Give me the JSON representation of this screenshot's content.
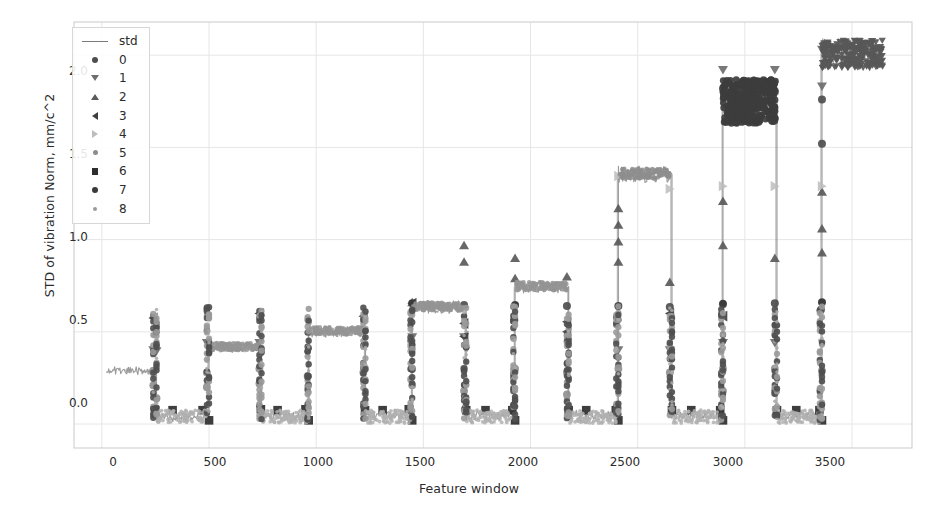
{
  "chart_data": {
    "type": "scatter",
    "title": "",
    "xlabel": "Feature window",
    "ylabel": "STD of vibration Norm, mm/c^2",
    "xlim": [
      -130,
      3780
    ],
    "ylim": [
      -0.13,
      2.18
    ],
    "xticks": [
      0,
      500,
      1000,
      1500,
      2000,
      2500,
      3000,
      3500
    ],
    "xticklabels": [
      "0",
      "500",
      "1000",
      "1500",
      "2000",
      "2500",
      "3000",
      "3500"
    ],
    "yticks": [
      0.0,
      0.5,
      1.0,
      1.5,
      2.0
    ],
    "yticklabels": [
      "0.0",
      "0.5",
      "1.0",
      "1.5",
      "2.0"
    ],
    "grid": true,
    "legend_position": "upper left",
    "legend_entries": [
      {
        "label": "std",
        "marker": "line",
        "color": "#7b7b7b"
      },
      {
        "label": "0",
        "marker": "circle",
        "color": "#4e4e4e"
      },
      {
        "label": "1",
        "marker": "triangle-down",
        "color": "#6e6e6e"
      },
      {
        "label": "2",
        "marker": "triangle-up",
        "color": "#5a5a5a"
      },
      {
        "label": "3",
        "marker": "triangle-left",
        "color": "#3f3f3f"
      },
      {
        "label": "4",
        "marker": "triangle-right",
        "color": "#bdbdbd"
      },
      {
        "label": "5",
        "marker": "circle-small",
        "color": "#8d8d8d"
      },
      {
        "label": "6",
        "marker": "square",
        "color": "#2e2e2e"
      },
      {
        "label": "7",
        "marker": "circle-med",
        "color": "#3a3a3a"
      },
      {
        "label": "8",
        "marker": "circle-tiny",
        "color": "#9b9b9b"
      }
    ],
    "series": [
      {
        "name": "std",
        "color": "#8a8a8a",
        "description": "Continuous std signal forming rising step plateaus with near-zero valleys",
        "segments": [
          {
            "x_start": 20,
            "x_end": 240,
            "level": 0.29,
            "noise": 0.022
          },
          {
            "x_start": 255,
            "x_end": 490,
            "level": 0.035,
            "noise": 0.025
          },
          {
            "x_start": 500,
            "x_end": 735,
            "level": 0.415,
            "noise": 0.028
          },
          {
            "x_start": 745,
            "x_end": 960,
            "level": 0.04,
            "noise": 0.025
          },
          {
            "x_start": 965,
            "x_end": 1220,
            "level": 0.5,
            "noise": 0.03
          },
          {
            "x_start": 1230,
            "x_end": 1440,
            "level": 0.045,
            "noise": 0.025
          },
          {
            "x_start": 1448,
            "x_end": 1690,
            "level": 0.635,
            "noise": 0.035
          },
          {
            "x_start": 1700,
            "x_end": 1920,
            "level": 0.05,
            "noise": 0.025
          },
          {
            "x_start": 1928,
            "x_end": 2170,
            "level": 0.745,
            "noise": 0.035
          },
          {
            "x_start": 2178,
            "x_end": 2400,
            "level": 0.05,
            "noise": 0.025
          },
          {
            "x_start": 2410,
            "x_end": 2650,
            "level": 1.355,
            "noise": 0.045
          },
          {
            "x_start": 2660,
            "x_end": 2890,
            "level": 0.05,
            "noise": 0.025
          },
          {
            "x_start": 2898,
            "x_end": 3140,
            "level": 1.755,
            "noise": 0.095
          },
          {
            "x_start": 3150,
            "x_end": 3350,
            "level": 0.05,
            "noise": 0.025
          },
          {
            "x_start": 3360,
            "x_end": 3640,
            "level": 2.015,
            "noise": 0.075
          }
        ]
      },
      {
        "name": "0",
        "marker": "circle",
        "color": "#4e4e4e",
        "description": "Mid-high cluster markers on the rising transitions",
        "points": [
          {
            "x": 1448,
            "y": 0.655
          },
          {
            "x": 1690,
            "y": 0.645
          },
          {
            "x": 1928,
            "y": 0.645
          },
          {
            "x": 2170,
            "y": 0.64
          },
          {
            "x": 2410,
            "y": 0.64
          },
          {
            "x": 2650,
            "y": 0.635
          },
          {
            "x": 2898,
            "y": 1.82
          },
          {
            "x": 3140,
            "y": 1.8
          },
          {
            "x": 2898,
            "y": 0.65
          },
          {
            "x": 3140,
            "y": 0.655
          },
          {
            "x": 3360,
            "y": 1.76
          },
          {
            "x": 3360,
            "y": 1.52
          },
          {
            "x": 3360,
            "y": 0.66
          },
          {
            "x": 3355,
            "y": 0.62
          }
        ]
      },
      {
        "name": "1",
        "marker": "triangle-down",
        "color": "#6e6e6e",
        "description": "Upper-extreme markers capping each plateau transition",
        "points": [
          {
            "x": 240,
            "y": 0.4
          },
          {
            "x": 255,
            "y": 0.395
          },
          {
            "x": 490,
            "y": 0.44
          },
          {
            "x": 735,
            "y": 0.44
          },
          {
            "x": 1220,
            "y": 0.5
          },
          {
            "x": 1448,
            "y": 0.47
          },
          {
            "x": 1690,
            "y": 0.47
          },
          {
            "x": 2410,
            "y": 0.4
          },
          {
            "x": 2650,
            "y": 0.4
          },
          {
            "x": 2898,
            "y": 1.92
          },
          {
            "x": 3140,
            "y": 1.92
          },
          {
            "x": 3360,
            "y": 2.03
          },
          {
            "x": 3360,
            "y": 1.83
          },
          {
            "x": 2898,
            "y": 0.44
          },
          {
            "x": 3140,
            "y": 0.44
          }
        ]
      },
      {
        "name": "2",
        "marker": "triangle-up",
        "color": "#5a5a5a",
        "description": "Peak markers of each step, rising left to right",
        "points": [
          {
            "x": 1448,
            "y": 0.66
          },
          {
            "x": 1690,
            "y": 0.97
          },
          {
            "x": 1690,
            "y": 0.88
          },
          {
            "x": 1928,
            "y": 0.9
          },
          {
            "x": 1928,
            "y": 0.79
          },
          {
            "x": 2170,
            "y": 0.8
          },
          {
            "x": 2410,
            "y": 1.17
          },
          {
            "x": 2410,
            "y": 1.08
          },
          {
            "x": 2410,
            "y": 0.99
          },
          {
            "x": 2410,
            "y": 0.88
          },
          {
            "x": 2650,
            "y": 0.77
          },
          {
            "x": 2898,
            "y": 1.21
          },
          {
            "x": 2898,
            "y": 0.97
          },
          {
            "x": 3140,
            "y": 0.9
          },
          {
            "x": 3360,
            "y": 1.26
          },
          {
            "x": 3360,
            "y": 1.06
          },
          {
            "x": 3360,
            "y": 0.93
          }
        ]
      },
      {
        "name": "3",
        "marker": "triangle-left",
        "color": "#3f3f3f",
        "description": "High single markers at segment starts",
        "points": [
          {
            "x": 240,
            "y": 0.575
          },
          {
            "x": 735,
            "y": 0.6
          },
          {
            "x": 1220,
            "y": 0.585
          },
          {
            "x": 1448,
            "y": 0.655
          },
          {
            "x": 1690,
            "y": 0.545
          },
          {
            "x": 1690,
            "y": 0.475
          },
          {
            "x": 2170,
            "y": 0.555
          },
          {
            "x": 2170,
            "y": 0.5
          },
          {
            "x": 2650,
            "y": 0.6
          },
          {
            "x": 2898,
            "y": 0.585
          }
        ]
      },
      {
        "name": "4",
        "marker": "triangle-right",
        "color": "#bdbdbd",
        "description": "Light-grey markers on plateau tops",
        "points": [
          {
            "x": 2410,
            "y": 1.345
          },
          {
            "x": 2650,
            "y": 1.275
          },
          {
            "x": 2898,
            "y": 1.29
          },
          {
            "x": 3140,
            "y": 1.29
          },
          {
            "x": 3360,
            "y": 1.29
          }
        ]
      },
      {
        "name": "5",
        "marker": "circle-small",
        "color": "#8d8d8d",
        "description": "Mid-low grey circles on the vertical transitions",
        "points": [
          {
            "x": 240,
            "y": 0.29
          },
          {
            "x": 240,
            "y": 0.21
          },
          {
            "x": 255,
            "y": 0.14
          },
          {
            "x": 490,
            "y": 0.28
          },
          {
            "x": 490,
            "y": 0.2
          },
          {
            "x": 735,
            "y": 0.3
          },
          {
            "x": 735,
            "y": 0.22
          },
          {
            "x": 960,
            "y": 0.26
          },
          {
            "x": 1220,
            "y": 0.28
          },
          {
            "x": 1448,
            "y": 0.3
          },
          {
            "x": 1448,
            "y": 0.21
          },
          {
            "x": 1690,
            "y": 0.3
          },
          {
            "x": 1690,
            "y": 0.18
          },
          {
            "x": 1928,
            "y": 0.3
          },
          {
            "x": 2170,
            "y": 0.28
          },
          {
            "x": 2170,
            "y": 0.16
          },
          {
            "x": 2410,
            "y": 0.3
          },
          {
            "x": 2650,
            "y": 0.28
          },
          {
            "x": 2898,
            "y": 0.3
          },
          {
            "x": 2898,
            "y": 0.18
          },
          {
            "x": 3140,
            "y": 0.3
          },
          {
            "x": 3140,
            "y": 0.17
          },
          {
            "x": 3360,
            "y": 0.29
          }
        ]
      },
      {
        "name": "6",
        "marker": "square",
        "color": "#2e2e2e",
        "description": "Dark squares sitting on the near-zero valley floor",
        "points": [
          {
            "x": 248,
            "y": 0.075
          },
          {
            "x": 330,
            "y": 0.075
          },
          {
            "x": 470,
            "y": 0.075
          },
          {
            "x": 500,
            "y": 0.02
          },
          {
            "x": 742,
            "y": 0.08
          },
          {
            "x": 820,
            "y": 0.075
          },
          {
            "x": 950,
            "y": 0.08
          },
          {
            "x": 965,
            "y": 0.02
          },
          {
            "x": 1228,
            "y": 0.075
          },
          {
            "x": 1310,
            "y": 0.075
          },
          {
            "x": 1432,
            "y": 0.08
          },
          {
            "x": 1448,
            "y": 0.02
          },
          {
            "x": 1700,
            "y": 0.075
          },
          {
            "x": 1790,
            "y": 0.075
          },
          {
            "x": 1915,
            "y": 0.075
          },
          {
            "x": 1928,
            "y": 0.02
          },
          {
            "x": 2178,
            "y": 0.075
          },
          {
            "x": 2260,
            "y": 0.075
          },
          {
            "x": 2398,
            "y": 0.075
          },
          {
            "x": 2410,
            "y": 0.02
          },
          {
            "x": 2660,
            "y": 0.075
          },
          {
            "x": 2750,
            "y": 0.075
          },
          {
            "x": 2885,
            "y": 0.075
          },
          {
            "x": 2898,
            "y": 0.02
          },
          {
            "x": 3150,
            "y": 0.075
          },
          {
            "x": 3240,
            "y": 0.075
          },
          {
            "x": 3348,
            "y": 0.075
          },
          {
            "x": 3360,
            "y": 0.02
          }
        ]
      },
      {
        "name": "7",
        "marker": "circle-med",
        "color": "#3a3a3a",
        "description": "Dark circles forming the dense high-level cluster near 1.65-1.85",
        "points": [
          {
            "x": 2900,
            "y": 1.8
          },
          {
            "x": 2950,
            "y": 1.78
          },
          {
            "x": 3000,
            "y": 1.74
          },
          {
            "x": 3050,
            "y": 1.72
          },
          {
            "x": 3100,
            "y": 1.76
          },
          {
            "x": 3135,
            "y": 1.8
          },
          {
            "x": 1448,
            "y": 0.655
          },
          {
            "x": 1928,
            "y": 0.645
          },
          {
            "x": 2410,
            "y": 0.64
          },
          {
            "x": 2898,
            "y": 0.655
          },
          {
            "x": 3360,
            "y": 0.66
          }
        ]
      },
      {
        "name": "8",
        "marker": "circle-tiny",
        "color": "#9b9b9b",
        "description": "Small light markers scattered along plateaus and transitions",
        "points": [
          {
            "x": 120,
            "y": 0.29
          },
          {
            "x": 600,
            "y": 0.42
          },
          {
            "x": 1100,
            "y": 0.5
          },
          {
            "x": 1560,
            "y": 0.635
          },
          {
            "x": 2050,
            "y": 0.745
          },
          {
            "x": 2520,
            "y": 1.355
          },
          {
            "x": 3010,
            "y": 1.755
          },
          {
            "x": 3500,
            "y": 2.015
          }
        ]
      }
    ]
  },
  "axes": {
    "ylabel": "STD of vibration Norm, mm/c^2",
    "xlabel": "Feature window",
    "yticklabels": [
      "2.0",
      "1.5",
      "1.0",
      "0.5",
      "0.0"
    ],
    "xticklabels": [
      "0",
      "500",
      "1000",
      "1500",
      "2000",
      "2500",
      "3000",
      "3500"
    ]
  },
  "legend": {
    "items": [
      {
        "label": "std",
        "marker_class": "lm-line"
      },
      {
        "label": "0",
        "marker_class": "lm-circle"
      },
      {
        "label": "1",
        "marker_class": "lm-tri-down"
      },
      {
        "label": "2",
        "marker_class": "lm-tri-up"
      },
      {
        "label": "3",
        "marker_class": "lm-tri-left"
      },
      {
        "label": "4",
        "marker_class": "lm-tri-right"
      },
      {
        "label": "5",
        "marker_class": "lm-circle-sm"
      },
      {
        "label": "6",
        "marker_class": "lm-square"
      },
      {
        "label": "7",
        "marker_class": "lm-circle-md"
      },
      {
        "label": "8",
        "marker_class": "lm-circle-xs"
      }
    ]
  },
  "colors": {
    "background": "#ffffff",
    "axis": "#c9c9c9",
    "grid": "#e6e6e6",
    "line": "#8a8a8a",
    "text": "#2b2b2b"
  }
}
